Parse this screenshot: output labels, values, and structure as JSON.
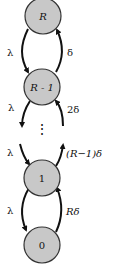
{
  "diagram": {
    "type": "birth-death-chain",
    "nodes": [
      {
        "id": "R",
        "label": "R"
      },
      {
        "id": "R-1",
        "label": "R - 1"
      },
      {
        "id": "1",
        "label": "1"
      },
      {
        "id": "0",
        "label": "0"
      }
    ],
    "ellipsis": "⋮",
    "edges": [
      {
        "from": "R",
        "to": "R-1",
        "label": "λ"
      },
      {
        "from": "R-1",
        "to": "R",
        "label": "δ"
      },
      {
        "from": "R-1",
        "to": "down",
        "label": "λ"
      },
      {
        "from": "down",
        "to": "R-1",
        "label": "2δ"
      },
      {
        "from": "up",
        "to": "1",
        "label": "λ"
      },
      {
        "from": "1",
        "to": "up",
        "label": "(R−1)δ"
      },
      {
        "from": "1",
        "to": "0",
        "label": "λ"
      },
      {
        "from": "0",
        "to": "1",
        "label": "Rδ"
      }
    ],
    "colors": {
      "node_fill": "#c8c8c8",
      "node_stroke": "#333333",
      "edge": "#111111"
    }
  }
}
